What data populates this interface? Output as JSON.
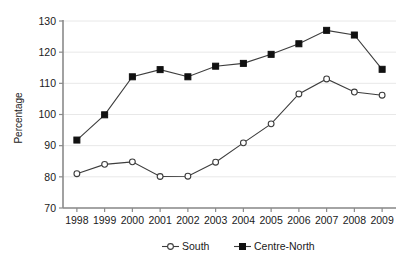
{
  "chart_data": {
    "type": "line",
    "title": "",
    "xlabel": "",
    "ylabel": "Percentage",
    "categories": [
      "1998",
      "1999",
      "2000",
      "2001",
      "2002",
      "2003",
      "2004",
      "2005",
      "2006",
      "2007",
      "2008",
      "2009"
    ],
    "series": [
      {
        "name": "South",
        "marker": "open-circle",
        "values": [
          81.0,
          84.0,
          84.8,
          80.1,
          80.2,
          84.7,
          90.9,
          97.0,
          106.6,
          111.4,
          107.2,
          106.2
        ]
      },
      {
        "name": "Centre-North",
        "marker": "filled-square",
        "values": [
          91.8,
          99.9,
          112.1,
          114.4,
          112.1,
          115.5,
          116.4,
          119.3,
          122.7,
          127.0,
          125.5,
          114.5
        ]
      }
    ],
    "ylim": [
      70,
      130
    ],
    "yticks": [
      70,
      80,
      90,
      100,
      110,
      120,
      130
    ],
    "ytick_labels": [
      "70",
      "80",
      "90",
      "100",
      "110",
      "120",
      "130"
    ],
    "grid": true,
    "legend_position": "bottom",
    "colors": {
      "south_marker_fill": "#ffffff",
      "south_line": "#3d3d3d",
      "centre_north_marker_fill": "#111111",
      "centre_north_line": "#3d3d3d",
      "gridline": "#e8e8e8",
      "axis": "#8a8a8a",
      "text": "#1a1a1a"
    }
  },
  "legend": {
    "entries": [
      {
        "label": "South"
      },
      {
        "label": "Centre-North"
      }
    ]
  }
}
